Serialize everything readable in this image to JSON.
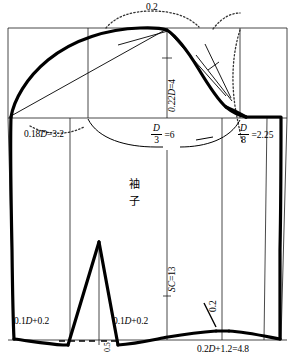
{
  "figure": {
    "name": "sleeve-pattern-draft",
    "title_cjk": "袖子",
    "title_cjk_lines": [
      "袖",
      "子"
    ],
    "ink_color": "#000000",
    "background_color": "#ffffff",
    "width": 295,
    "height": 360
  },
  "labels": {
    "cap_ease_top": "0.2",
    "cap_height": "0.22D=4",
    "left_front_notch": "0.18D=3.2",
    "center_depth_value": "=6",
    "center_depth_num": "D",
    "center_depth_den": "3",
    "right_back_value": "=2.25",
    "right_back_num": "D",
    "right_back_den": "8",
    "sleeve_length": "SC=13",
    "hem_left": "0.1D+0.2",
    "hem_mid": "0.1D+0.2",
    "vent_depth": "0.5",
    "cuff_rise": "0.2",
    "cuff_width": "0.2D+1.2=4.8"
  },
  "geometry": {
    "frame_left_x": 8,
    "frame_right_x": 287,
    "biceps_line_y": 118,
    "cap_top_y": 28,
    "hem_y": 340
  }
}
